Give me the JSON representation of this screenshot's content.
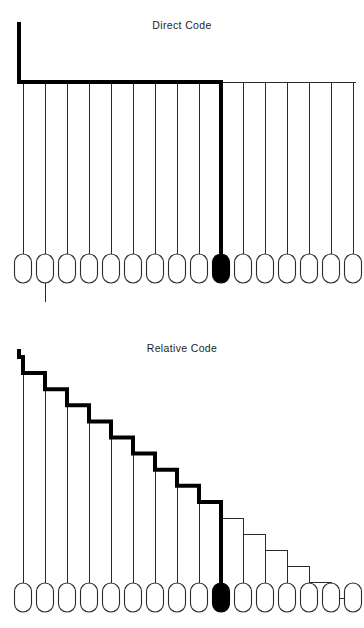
{
  "page": {
    "background_color": "#ffffff",
    "ink_color": "#1a1a1a",
    "accent_color": "#000000",
    "width": 364,
    "height": 628
  },
  "figures": [
    {
      "id": "direct",
      "title": "Direct Code",
      "layout": "bus",
      "leaf_count": 16,
      "selected_leaf_index": 10,
      "highlight_color": "#000000",
      "line_color": "#2a2a2a",
      "geometry": {
        "first_leaf_center_x": 23,
        "leaf_spacing": 22,
        "leaf_width": 17,
        "leaf_height": 29,
        "leaf_top_y": 254,
        "bus_y": 82,
        "stem_x": 19,
        "stem_top_y": 24,
        "thick_end_x": 213,
        "bus_right_x": 356,
        "overshoot_leaf_index": 2,
        "overshoot_bottom_y": 302
      }
    },
    {
      "id": "relative",
      "title": "Relative Code",
      "layout": "staircase",
      "leaf_count": 16,
      "selected_leaf_index": 10,
      "highlight_color": "#000000",
      "line_color": "#2a2a2a",
      "geometry": {
        "first_leaf_center_x": 23,
        "leaf_spacing": 22,
        "leaf_width": 17,
        "leaf_height": 29,
        "leaf_top_y": 583,
        "stair_top_y": 357,
        "stair_step_height": 16.1,
        "stem_x": 19,
        "thick_through_leaf_index": 10
      }
    }
  ],
  "chart_data": {
    "type": "diagram",
    "panels": [
      {
        "name": "Direct Code",
        "nodes": 16,
        "selected_node": 10,
        "path_style": "single horizontal bus with one vertical stem; highlighted path runs from the stem along the bus to node 10"
      },
      {
        "name": "Relative Code",
        "nodes": 16,
        "selected_node": 10,
        "path_style": "descending staircase; highlighted path steps down from node 1 to node 10"
      }
    ]
  }
}
